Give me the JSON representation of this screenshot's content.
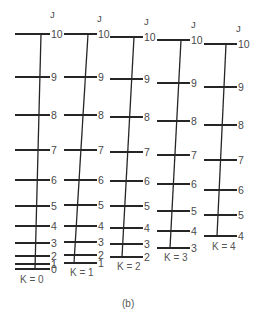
{
  "figure": {
    "caption": "(b)",
    "column_header": "J",
    "colors": {
      "line": "#262626",
      "text": "#4a4a4a",
      "background": "#ffffff"
    }
  },
  "columns": [
    {
      "k_label": "K = 0",
      "header": "J",
      "x_left": 15,
      "x_right": 50,
      "stem_top_x": 41,
      "stem_bottom_x": 35,
      "header_pos": [
        50,
        18
      ],
      "k_label_pos": [
        20,
        283
      ],
      "levels": [
        {
          "j": "10",
          "y": 34
        },
        {
          "j": "9",
          "y": 77
        },
        {
          "j": "8",
          "y": 115
        },
        {
          "j": "7",
          "y": 150
        },
        {
          "j": "6",
          "y": 180
        },
        {
          "j": "5",
          "y": 206
        },
        {
          "j": "4",
          "y": 226
        },
        {
          "j": "3",
          "y": 243
        },
        {
          "j": "2",
          "y": 256
        },
        {
          "j": "1",
          "y": 264
        },
        {
          "j": "0",
          "y": 269
        }
      ]
    },
    {
      "k_label": "K = 1",
      "header": "J",
      "x_left": 64,
      "x_right": 97,
      "stem_top_x": 88,
      "stem_bottom_x": 74,
      "header_pos": [
        97,
        22
      ],
      "k_label_pos": [
        70,
        276
      ],
      "levels": [
        {
          "j": "10",
          "y": 34
        },
        {
          "j": "9",
          "y": 77
        },
        {
          "j": "8",
          "y": 115
        },
        {
          "j": "7",
          "y": 150
        },
        {
          "j": "6",
          "y": 180
        },
        {
          "j": "5",
          "y": 205
        },
        {
          "j": "4",
          "y": 226
        },
        {
          "j": "3",
          "y": 242
        },
        {
          "j": "2",
          "y": 255
        },
        {
          "j": "1",
          "y": 263
        }
      ]
    },
    {
      "k_label": "K = 2",
      "header": "J",
      "x_left": 110,
      "x_right": 143,
      "stem_top_x": 134,
      "stem_bottom_x": 122,
      "header_pos": [
        144,
        25
      ],
      "k_label_pos": [
        117,
        270
      ],
      "levels": [
        {
          "j": "10",
          "y": 37
        },
        {
          "j": "9",
          "y": 79
        },
        {
          "j": "8",
          "y": 117
        },
        {
          "j": "7",
          "y": 152
        },
        {
          "j": "6",
          "y": 181
        },
        {
          "j": "5",
          "y": 206
        },
        {
          "j": "4",
          "y": 228
        },
        {
          "j": "3",
          "y": 244
        },
        {
          "j": "2",
          "y": 257
        }
      ]
    },
    {
      "k_label": "K = 3",
      "header": "J",
      "x_left": 157,
      "x_right": 190,
      "stem_top_x": 181,
      "stem_bottom_x": 170,
      "header_pos": [
        191,
        28
      ],
      "k_label_pos": [
        164,
        261
      ],
      "levels": [
        {
          "j": "10",
          "y": 40
        },
        {
          "j": "9",
          "y": 83
        },
        {
          "j": "8",
          "y": 121
        },
        {
          "j": "7",
          "y": 155
        },
        {
          "j": "6",
          "y": 184
        },
        {
          "j": "5",
          "y": 211
        },
        {
          "j": "4",
          "y": 231
        },
        {
          "j": "3",
          "y": 248
        }
      ]
    },
    {
      "k_label": "K = 4",
      "header": "J",
      "x_left": 204,
      "x_right": 237,
      "stem_top_x": 226,
      "stem_bottom_x": 217,
      "header_pos": [
        236,
        32
      ],
      "k_label_pos": [
        212,
        250
      ],
      "levels": [
        {
          "j": "10",
          "y": 44
        },
        {
          "j": "9",
          "y": 87
        },
        {
          "j": "8",
          "y": 125
        },
        {
          "j": "7",
          "y": 160
        },
        {
          "j": "6",
          "y": 190
        },
        {
          "j": "5",
          "y": 215
        },
        {
          "j": "4",
          "y": 236
        }
      ]
    }
  ]
}
